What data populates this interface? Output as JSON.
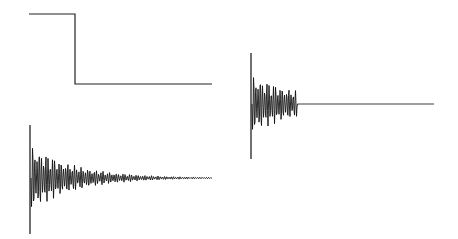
{
  "chart_data": [
    {
      "type": "line",
      "title": "",
      "description": "Step function (input signal): high level then drops to low level",
      "xlabel": "",
      "ylabel": "",
      "x": [
        0,
        0.25,
        0.25,
        1.0
      ],
      "values": [
        1,
        1,
        0,
        0
      ],
      "grid": false
    },
    {
      "type": "line",
      "title": "",
      "description": "Impulse response: damped oscillation decaying slowly to zero",
      "xlabel": "",
      "ylabel": "",
      "envelope": "exponential decay",
      "initial_amplitude": 1.0,
      "decay_extent_fraction": 0.7,
      "grid": false
    },
    {
      "type": "line",
      "title": "",
      "description": "Truncated impulse response: damped oscillation cut off early, then zero",
      "xlabel": "",
      "ylabel": "",
      "envelope": "exponential decay, truncated",
      "initial_amplitude": 1.0,
      "truncation_fraction": 0.25,
      "grid": false
    }
  ],
  "colors": {
    "line": "#111111",
    "background": "#ffffff"
  }
}
